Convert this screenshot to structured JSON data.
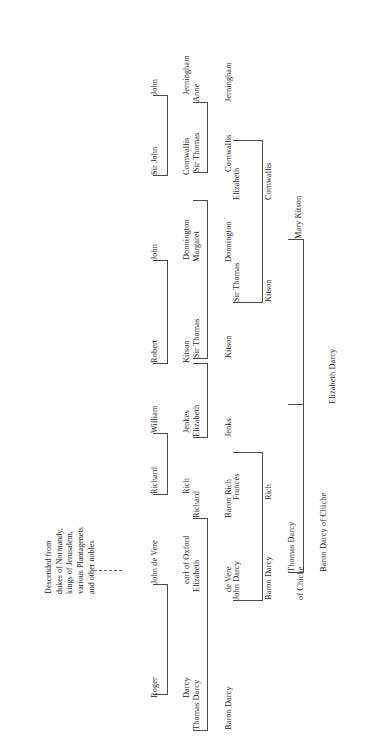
{
  "document": {
    "kind": "genealogical-ancestry-chart",
    "orientation": "rotated-90-ccw",
    "background_color": "#ffffff",
    "line_color": "#4a4a4a",
    "text_color": "#1c1c1c"
  },
  "note": {
    "lines": [
      "Descended from",
      "dukes of Normandy,",
      "kings of Jerusalem,",
      "various Plantagenets",
      "and other nobles"
    ],
    "connector": "dashed"
  },
  "generations": [
    {
      "index": 1,
      "people": [
        {
          "id": "roger-darcy",
          "lines": [
            "Roger",
            "Darcy"
          ]
        },
        {
          "id": "john-de-vere",
          "lines": [
            "John de Vere",
            "earl of Oxford"
          ]
        },
        {
          "id": "richard-rich",
          "lines": [
            "Richard",
            "Rich"
          ]
        },
        {
          "id": "william-jenkes",
          "lines": [
            "William",
            "Jenkes"
          ]
        },
        {
          "id": "robert-kitson",
          "lines": [
            "Robert",
            "Kitson"
          ]
        },
        {
          "id": "john-donnington",
          "lines": [
            "John",
            "Donnington"
          ]
        },
        {
          "id": "sir-john-cornwallis",
          "lines": [
            "Sir John",
            "Cornwallis"
          ]
        },
        {
          "id": "john-jerningham",
          "lines": [
            "John",
            "Jerningham"
          ]
        }
      ]
    },
    {
      "index": 2,
      "people": [
        {
          "id": "thomas-darcy-baron-darcy",
          "lines": [
            "Thomas Darcy",
            "Baron Darcy"
          ]
        },
        {
          "id": "elizabeth-de-vere",
          "lines": [
            "Elizabeth",
            "de Vere"
          ]
        },
        {
          "id": "richard-baron-rich",
          "lines": [
            "Richard",
            "Baron Rich"
          ]
        },
        {
          "id": "elizabeth-jenks",
          "lines": [
            "Elizabeth",
            "Jenks"
          ]
        },
        {
          "id": "sir-thomas-kitson-1",
          "lines": [
            "Sir Thomas",
            "Kitson"
          ]
        },
        {
          "id": "margaret-donnington",
          "lines": [
            "Margaret",
            "Donnington"
          ]
        },
        {
          "id": "sir-thomas-cornwallis",
          "lines": [
            "Sir Thomas",
            "Cornwallis"
          ]
        },
        {
          "id": "anne-jerningham",
          "lines": [
            "Anne",
            "Jerningham"
          ]
        }
      ]
    },
    {
      "index": 3,
      "people": [
        {
          "id": "john-darcy-baron-darcy-of-chiche",
          "lines": [
            "John Darcy",
            "Baron Darcy",
            "of Chiche"
          ]
        },
        {
          "id": "frances-rich",
          "lines": [
            "Frances",
            "Rich"
          ]
        },
        {
          "id": "sir-thomas-kitson-2",
          "lines": [
            "Sir Thomas",
            "Kitson"
          ]
        },
        {
          "id": "elizabeth-cornwallis",
          "lines": [
            "Elizabeth",
            "Cornwallis"
          ]
        }
      ]
    },
    {
      "index": 4,
      "people": [
        {
          "id": "thomas-darcy-baron-darcy-of-chiche",
          "lines": [
            "Thomas Darcy",
            "Baron Darcy of Chiche"
          ]
        },
        {
          "id": "mary-kitson",
          "lines": [
            "Mary Kitson"
          ]
        }
      ]
    },
    {
      "index": 5,
      "people": [
        {
          "id": "elizabeth-darcy",
          "lines": [
            "Elizabeth Darcy"
          ]
        }
      ]
    }
  ]
}
